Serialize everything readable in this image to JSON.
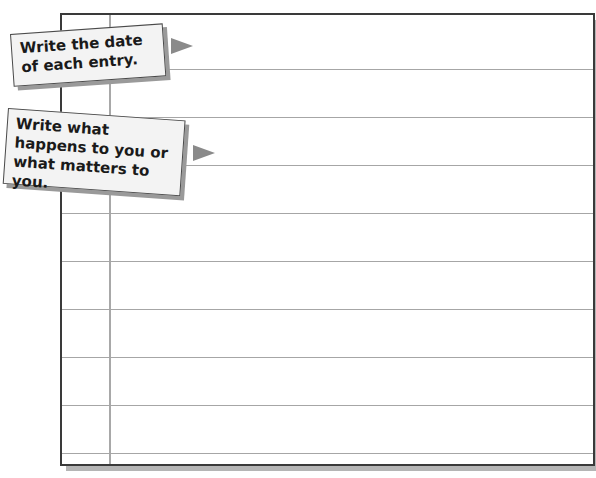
{
  "journal_page": {
    "row_count": 9,
    "rule_positions_px": [
      56,
      104,
      152,
      200,
      248,
      296,
      344,
      392,
      440
    ],
    "colors": {
      "border": "#3a3a3a",
      "rule": "#a6a6a6",
      "margin_line": "#a8a8a8",
      "shadow": "#b5b5b5",
      "callout_bg": "#f3f3f3",
      "arrow": "#8a8a8a"
    }
  },
  "callouts": [
    {
      "text": "Write the date of each entry.",
      "points_to": "date-column"
    },
    {
      "text": "Write what happens to you or what matters to you.",
      "points_to": "entry-area"
    }
  ]
}
